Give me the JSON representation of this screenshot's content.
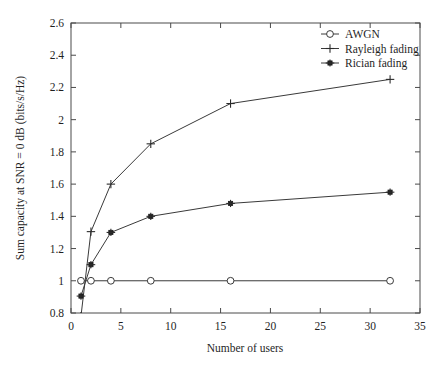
{
  "chart_data": {
    "type": "line",
    "title": "",
    "xlabel": "Number of users",
    "ylabel": "Sum capacity at SNR = 0 dB (bits/s/Hz)",
    "xlim": [
      0,
      35
    ],
    "ylim": [
      0.8,
      2.6
    ],
    "xticks": [
      "0",
      "5",
      "10",
      "15",
      "20",
      "25",
      "30",
      "35"
    ],
    "xtick_values": [
      0,
      5,
      10,
      15,
      20,
      25,
      30,
      35
    ],
    "yticks": [
      "0.8",
      "1",
      "1.2",
      "1.4",
      "1.6",
      "1.8",
      "2",
      "2.2",
      "2.4",
      "2.6"
    ],
    "ytick_values": [
      0.8,
      1,
      1.2,
      1.4,
      1.6,
      1.8,
      2,
      2.2,
      2.4,
      2.6
    ],
    "grid": false,
    "legend_position": "top-right",
    "x": [
      1,
      2,
      4,
      8,
      16,
      32
    ],
    "series": [
      {
        "name": "AWGN",
        "marker": "circle-open",
        "x": [
          1,
          2,
          4,
          8,
          16,
          32
        ],
        "values": [
          1.0,
          1.0,
          1.0,
          1.0,
          1.0,
          1.0
        ]
      },
      {
        "name": "Rayleigh fading",
        "marker": "plus",
        "x": [
          1,
          2,
          4,
          8,
          16,
          32
        ],
        "values": [
          0.78,
          1.305,
          1.6,
          1.85,
          2.1,
          2.25
        ]
      },
      {
        "name": "Rician fading",
        "marker": "star-solid",
        "x": [
          1,
          2,
          4,
          8,
          16,
          32
        ],
        "values": [
          0.905,
          1.1,
          1.3,
          1.4,
          1.48,
          1.55
        ]
      }
    ]
  },
  "legend": {
    "entries": [
      {
        "label": "AWGN",
        "marker": "circle-open"
      },
      {
        "label": "Rayleigh fading",
        "marker": "plus"
      },
      {
        "label": "Rician fading",
        "marker": "star-solid"
      }
    ]
  },
  "axes": {
    "x_title": "Number of users",
    "y_title": "Sum capacity at SNR = 0 dB (bits/s/Hz)"
  },
  "colors": {
    "line": "#3a3a3a",
    "frame": "#4a4a4a",
    "text": "#1f1f1f",
    "background": "#ffffff"
  }
}
